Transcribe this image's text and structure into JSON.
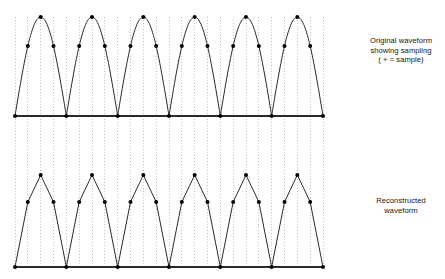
{
  "figure": {
    "name": "sampling-and-reconstruction-diagram",
    "background_color": "#ffffff",
    "width": 445,
    "height": 279
  },
  "captions": {
    "original": {
      "line1": "Original waveform",
      "line2": "showing sampling",
      "line3": "( +  =  sample)"
    },
    "reconstructed": {
      "line1": "Reconstructed",
      "line2": "waveform"
    }
  },
  "style": {
    "curve_color": "#2b2b2b",
    "baseline_color": "#2b2b2b",
    "sample_dot_color": "#000000",
    "guide_line_color": "#9a9a9a",
    "curve_width": 1.0,
    "baseline_width": 1.4,
    "sample_dot_radius": 2.0,
    "guide_dash": "1,2"
  },
  "chart_data": {
    "type": "line",
    "title": "",
    "xlabel": "",
    "ylabel": "",
    "grid": false,
    "legend": "none",
    "geometry": {
      "x_start": 15,
      "x_end": 323,
      "cycles": 6,
      "period_px": 51.33,
      "samples_per_cycle": 4,
      "sample_spacing_px": 12.833,
      "top_baseline_y": 116,
      "top_peak_y": 17,
      "top_amplitude_px": 99,
      "bottom_baseline_y": 267,
      "bottom_peak_y": 175,
      "bottom_amplitude_px": 92,
      "guide_top_y": 17,
      "guide_bottom_y": 267
    },
    "sample_levels_normalized": [
      0.0,
      0.7071,
      1.0,
      0.7071
    ],
    "series": [
      {
        "name": "Original waveform (rectified sine)",
        "plot": "top",
        "curve": "smooth",
        "samples_count": 25
      },
      {
        "name": "Reconstructed waveform (linear interpolation)",
        "plot": "bottom",
        "curve": "piecewise-linear",
        "samples_count": 25
      }
    ]
  }
}
